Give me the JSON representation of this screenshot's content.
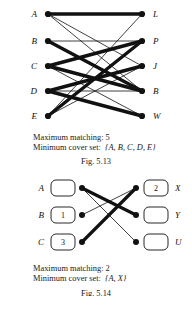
{
  "page": {
    "background": "#ffffff",
    "ink": "#111111"
  },
  "figures": [
    {
      "id": "fig-5-13",
      "type": "bipartite-graph",
      "left_nodes": [
        {
          "label": "A",
          "x": 48,
          "y": 14
        },
        {
          "label": "B",
          "x": 48,
          "y": 41
        },
        {
          "label": "C",
          "x": 48,
          "y": 66
        },
        {
          "label": "D",
          "x": 48,
          "y": 91
        },
        {
          "label": "E",
          "x": 48,
          "y": 116
        }
      ],
      "right_nodes": [
        {
          "label": "L",
          "x": 142,
          "y": 14
        },
        {
          "label": "P",
          "x": 142,
          "y": 41
        },
        {
          "label": "J",
          "x": 142,
          "y": 66
        },
        {
          "label": "B",
          "x": 142,
          "y": 91
        },
        {
          "label": "W",
          "x": 142,
          "y": 116
        }
      ],
      "edges": [
        {
          "from": "A",
          "to": "L",
          "weight": "thick"
        },
        {
          "from": "A",
          "to": "J",
          "weight": "thin"
        },
        {
          "from": "A",
          "to": "B",
          "weight": "thin"
        },
        {
          "from": "B",
          "to": "P",
          "weight": "thin"
        },
        {
          "from": "B",
          "to": "B",
          "weight": "thick"
        },
        {
          "from": "C",
          "to": "P",
          "weight": "thick"
        },
        {
          "from": "C",
          "to": "B",
          "weight": "thick"
        },
        {
          "from": "C",
          "to": "W",
          "weight": "thin"
        },
        {
          "from": "D",
          "to": "J",
          "weight": "thick"
        },
        {
          "from": "D",
          "to": "B",
          "weight": "thin"
        },
        {
          "from": "D",
          "to": "W",
          "weight": "thick"
        },
        {
          "from": "E",
          "to": "L",
          "weight": "thin"
        },
        {
          "from": "E",
          "to": "P",
          "weight": "thick"
        },
        {
          "from": "E",
          "to": "J",
          "weight": "thin"
        }
      ],
      "caption": {
        "matching_line": "Maximum matching: 5",
        "cover_label": "Minimum cover set:",
        "cover_value": "{A, B, C, D, E}"
      },
      "fig_label": "Fig. 5.13"
    },
    {
      "id": "fig-5-14",
      "type": "bipartite-graph-boxed",
      "left_nodes": [
        {
          "label": "A",
          "value": "",
          "x": 82,
          "y": 213
        },
        {
          "label": "B",
          "value": "1",
          "x": 82,
          "y": 240
        },
        {
          "label": "C",
          "value": "3",
          "x": 82,
          "y": 267
        }
      ],
      "right_nodes": [
        {
          "label": "X",
          "value": "2",
          "x": 136,
          "y": 213
        },
        {
          "label": "Y",
          "value": "",
          "x": 136,
          "y": 240
        },
        {
          "label": "U",
          "value": "",
          "x": 136,
          "y": 267
        }
      ],
      "edges": [
        {
          "from": "A",
          "to": "Y",
          "weight": "thick"
        },
        {
          "from": "A",
          "to": "U",
          "weight": "thin"
        },
        {
          "from": "B",
          "to": "X",
          "weight": "thin"
        },
        {
          "from": "C",
          "to": "X",
          "weight": "thick"
        }
      ],
      "caption": {
        "matching_line": "Maximum matching: 2",
        "cover_label": "Minimum cover set:",
        "cover_value": "{A, X}"
      },
      "fig_label": "Fig. 5.14"
    }
  ]
}
